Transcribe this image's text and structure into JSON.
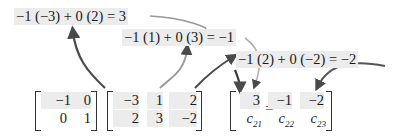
{
  "equations": {
    "eq1": "−1 (−3) + 0 (2) = 3",
    "eq2": "−1 (1) + 0 (3) = −1",
    "eq3": "−1 (2) + 0 (−2) = −2"
  },
  "matrix_a": {
    "rows": [
      [
        "−1",
        "0"
      ],
      [
        "0",
        "1"
      ]
    ]
  },
  "matrix_b": {
    "rows": [
      [
        "−3",
        "1",
        "2"
      ],
      [
        "2",
        "3",
        "−2"
      ]
    ]
  },
  "equals_sign": "=",
  "matrix_c": {
    "row1": [
      "3",
      "−1",
      "−2"
    ],
    "row2": [
      {
        "base": "c",
        "sub": "21"
      },
      {
        "base": "c",
        "sub": "22"
      },
      {
        "base": "c",
        "sub": "23"
      }
    ]
  },
  "colors": {
    "arrow": "#555555",
    "highlight": "#ececec"
  }
}
